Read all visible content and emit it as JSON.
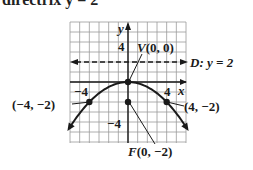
{
  "header": {
    "partial_text": "directrix y = 2"
  },
  "chart_data": {
    "type": "line",
    "title": "",
    "xlabel": "x",
    "ylabel": "y",
    "xlim": [
      -6,
      6
    ],
    "ylim": [
      -6,
      6
    ],
    "grid": true,
    "equation": "x^2 = -8y",
    "series": [
      {
        "name": "parabola",
        "x": [
          -6,
          -5,
          -4,
          -3,
          -2,
          -1,
          0,
          1,
          2,
          3,
          4,
          5,
          6
        ],
        "y": [
          -4.5,
          -3.125,
          -2,
          -1.125,
          -0.5,
          -0.125,
          0,
          -0.125,
          -0.5,
          -1.125,
          -2,
          -3.125,
          -4.5
        ]
      }
    ],
    "points": [
      {
        "label": "V(0, 0)",
        "x": 0,
        "y": 0
      },
      {
        "label": "F(0, -2)",
        "x": 0,
        "y": -2
      },
      {
        "label": "(-4, -2)",
        "x": -4,
        "y": -2
      },
      {
        "label": "(4, -2)",
        "x": 4,
        "y": -2
      }
    ],
    "directrix": {
      "label": "D: y = 2",
      "y": 2,
      "style": "dashed"
    },
    "tick_labels": {
      "x": [
        "-4",
        "4"
      ],
      "y": [
        "4",
        "-4"
      ]
    }
  },
  "labels": {
    "y_axis": "y",
    "x_axis": "x",
    "tick_y_pos": "4",
    "tick_y_neg": "−4",
    "tick_x_neg": "−4",
    "tick_x_pos": "4",
    "vertex_prefix": "V",
    "vertex_coords": "(0, 0)",
    "directrix_prefix": "D:",
    "directrix_eq": "y = 2",
    "focus_prefix": "F",
    "focus_coords": "(0, −2)",
    "left_point": "(−4, −2)",
    "right_point": "(4, −2)"
  },
  "colors": {
    "grid": "#9a9a9a",
    "ink": "#1a1a1a",
    "background": "#ffffff"
  }
}
